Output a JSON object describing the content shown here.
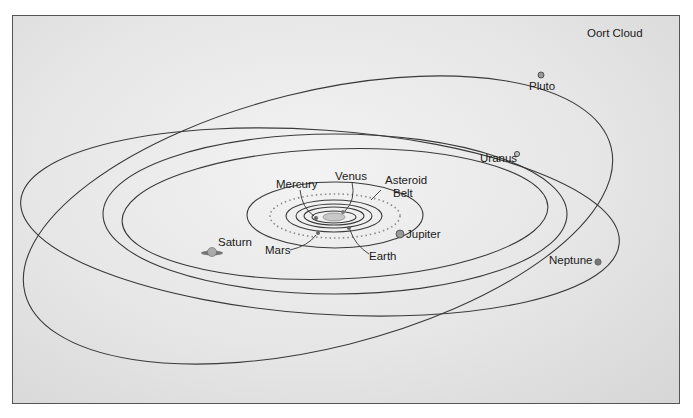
{
  "diagram": {
    "title_region": "Oort Cloud",
    "labels": {
      "oort_cloud": "Oort Cloud",
      "pluto": "Pluto",
      "uranus": "Uranus",
      "neptune": "Neptune",
      "saturn": "Saturn",
      "jupiter": "Jupiter",
      "mars": "Mars",
      "earth": "Earth",
      "mercury": "Mercury",
      "venus": "Venus",
      "asteroid_belt_line1": "Asteroid",
      "asteroid_belt_line2": "Belt"
    },
    "colors": {
      "orbit_line": "#3a3a3a",
      "background_light": "#f3f3f3",
      "background_dark": "#d6d6d6",
      "frame_border": "#555555",
      "planet_fill": "#8a8a8a"
    }
  }
}
